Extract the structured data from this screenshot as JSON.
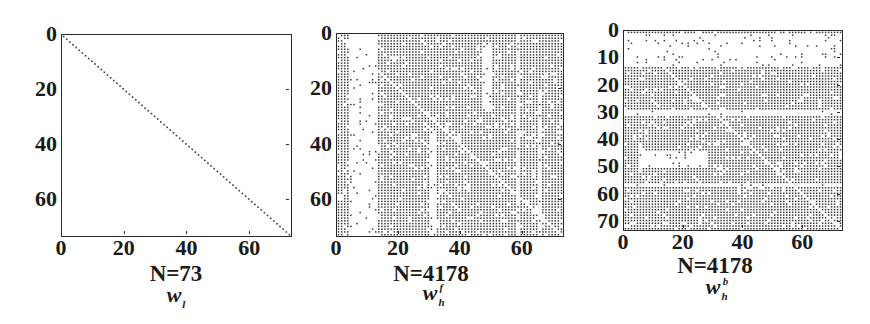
{
  "figure": {
    "panels": [
      {
        "id": "wl",
        "caption": "N=73",
        "symbol_base": "w",
        "symbol_sub": "l",
        "symbol_sup": ""
      },
      {
        "id": "whf",
        "caption": "N=4178",
        "symbol_base": "w",
        "symbol_sub": "h",
        "symbol_sup": "f"
      },
      {
        "id": "whb",
        "caption": "N=4178",
        "symbol_base": "w",
        "symbol_sub": "h",
        "symbol_sup": "b"
      }
    ]
  },
  "chart_data": [
    {
      "type": "heatmap",
      "subtype": "sparsity-pattern",
      "title": "",
      "caption": "N=73",
      "symbol": "w_l",
      "xlabel": "",
      "ylabel": "",
      "matrix_size": 73,
      "nonzeros": 73,
      "xlim": [
        0,
        73
      ],
      "ylim": [
        73,
        0
      ],
      "xticks": [
        0,
        20,
        40,
        60
      ],
      "yticks": [
        0,
        20,
        40,
        60
      ],
      "pattern": "diagonal only (identity-like)",
      "dense_regions": [],
      "empty_regions": [],
      "diagonal": "filled"
    },
    {
      "type": "heatmap",
      "subtype": "sparsity-pattern",
      "title": "",
      "caption": "N=4178",
      "symbol": "w_h^f",
      "xlabel": "",
      "ylabel": "",
      "matrix_size": 73,
      "nonzeros": 4178,
      "xlim": [
        0,
        73
      ],
      "ylim": [
        73,
        0
      ],
      "xticks": [
        0,
        20,
        40,
        60
      ],
      "yticks": [
        0,
        20,
        40,
        60
      ],
      "pattern": "mostly dense; sparse column band at columns ~4-13; white diagonal",
      "dense_regions": [
        [
          0,
          73,
          13,
          73
        ],
        [
          0,
          73,
          0,
          4
        ]
      ],
      "empty_regions": [
        [
          0,
          36,
          5,
          13
        ],
        [
          40,
          73,
          6,
          13
        ],
        [
          3,
          28,
          47,
          50
        ],
        [
          36,
          73,
          30,
          32
        ],
        [
          0,
          73,
          58,
          59
        ],
        [
          20,
          73,
          65,
          66
        ]
      ],
      "diagonal": "empty"
    },
    {
      "type": "heatmap",
      "subtype": "sparsity-pattern",
      "title": "",
      "caption": "N=4178",
      "symbol": "w_h^b",
      "xlabel": "",
      "ylabel": "",
      "matrix_size": 73,
      "nonzeros": 4178,
      "xlim": [
        0,
        73
      ],
      "ylim": [
        73,
        0
      ],
      "xticks": [
        0,
        20,
        40,
        60
      ],
      "yticks": [
        0,
        10,
        20,
        30,
        40,
        50,
        60,
        70
      ],
      "pattern": "mostly dense; sparse row band at rows ~2-13; white diagonal",
      "dense_regions": [
        [
          0,
          1,
          0,
          73
        ],
        [
          13,
          73,
          0,
          73
        ]
      ],
      "empty_regions": [
        [
          2,
          13,
          0,
          73
        ],
        [
          29,
          31,
          0,
          73
        ],
        [
          44,
          50,
          5,
          28
        ],
        [
          56,
          57,
          0,
          73
        ]
      ],
      "diagonal": "empty"
    }
  ]
}
